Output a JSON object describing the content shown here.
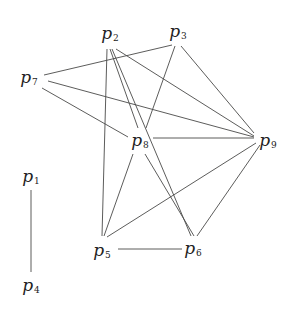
{
  "diagram": {
    "type": "graph",
    "nodes": [
      {
        "id": "p1",
        "letter": "p",
        "sub": "1",
        "x": 31,
        "y": 177
      },
      {
        "id": "p2",
        "letter": "p",
        "sub": "2",
        "x": 110,
        "y": 34
      },
      {
        "id": "p3",
        "letter": "p",
        "sub": "3",
        "x": 178,
        "y": 32
      },
      {
        "id": "p4",
        "letter": "p",
        "sub": "4",
        "x": 31,
        "y": 286
      },
      {
        "id": "p5",
        "letter": "p",
        "sub": "5",
        "x": 102,
        "y": 251
      },
      {
        "id": "p6",
        "letter": "p",
        "sub": "6",
        "x": 193,
        "y": 249
      },
      {
        "id": "p7",
        "letter": "p",
        "sub": "7",
        "x": 29,
        "y": 78
      },
      {
        "id": "p8",
        "letter": "p",
        "sub": "8",
        "x": 140,
        "y": 141
      },
      {
        "id": "p9",
        "letter": "p",
        "sub": "9",
        "x": 268,
        "y": 141
      }
    ],
    "edges": [
      {
        "from": "p1",
        "to": "p4",
        "x1": 31,
        "y1": 190,
        "x2": 31,
        "y2": 272
      },
      {
        "from": "p7",
        "to": "p3",
        "x1": 44,
        "y1": 75,
        "x2": 172,
        "y2": 45
      },
      {
        "from": "p7",
        "to": "p8",
        "x1": 42,
        "y1": 88,
        "x2": 128,
        "y2": 137
      },
      {
        "from": "p7",
        "to": "p9",
        "x1": 48,
        "y1": 81,
        "x2": 254,
        "y2": 137
      },
      {
        "from": "p2",
        "to": "p5",
        "x1": 107,
        "y1": 49,
        "x2": 102,
        "y2": 236
      },
      {
        "from": "p2",
        "to": "p8",
        "x1": 110,
        "y1": 49,
        "x2": 138,
        "y2": 128
      },
      {
        "from": "p2",
        "to": "p6",
        "x1": 112,
        "y1": 49,
        "x2": 191,
        "y2": 236
      },
      {
        "from": "p2",
        "to": "p9",
        "x1": 116,
        "y1": 49,
        "x2": 254,
        "y2": 136
      },
      {
        "from": "p3",
        "to": "p8",
        "x1": 175,
        "y1": 46,
        "x2": 146,
        "y2": 128
      },
      {
        "from": "p3",
        "to": "p9",
        "x1": 181,
        "y1": 46,
        "x2": 254,
        "y2": 133
      },
      {
        "from": "p8",
        "to": "p9",
        "x1": 153,
        "y1": 138,
        "x2": 254,
        "y2": 138
      },
      {
        "from": "p8",
        "to": "p5",
        "x1": 133,
        "y1": 154,
        "x2": 104,
        "y2": 236
      },
      {
        "from": "p8",
        "to": "p6",
        "x1": 145,
        "y1": 154,
        "x2": 194,
        "y2": 236
      },
      {
        "from": "p5",
        "to": "p9",
        "x1": 107,
        "y1": 237,
        "x2": 256,
        "y2": 143
      },
      {
        "from": "p6",
        "to": "p9",
        "x1": 197,
        "y1": 236,
        "x2": 260,
        "y2": 145
      },
      {
        "from": "p5",
        "to": "p6",
        "x1": 118,
        "y1": 249,
        "x2": 182,
        "y2": 249
      }
    ]
  }
}
